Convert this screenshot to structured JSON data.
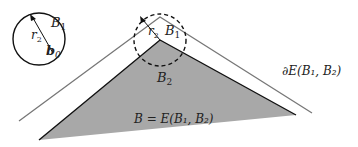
{
  "diagram": {
    "labels": {
      "small_ball_set": "B",
      "small_ball_set_sub": "1",
      "small_ball_radius": "r",
      "small_ball_radius_sub": "2",
      "center": "b",
      "center_sub": "0",
      "apex_radius": "r",
      "apex_radius_sub": "2",
      "apex_set": "B",
      "apex_set_sub": "1",
      "triangle_set": "B",
      "triangle_set_sub": "2",
      "boundary_label": "∂E(B₁, B₂)",
      "equation_label": "B = E(B₁, B₂)"
    },
    "colors": {
      "triangle_fill": "#a8a8a8",
      "triangle_edge": "#111111",
      "boundary_line": "#666666",
      "circle": "#111111"
    }
  }
}
